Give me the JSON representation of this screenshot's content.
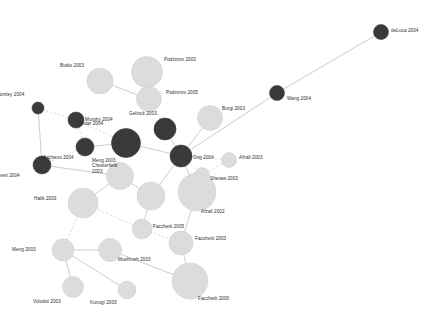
{
  "figure": {
    "kind": "citation-network-graph",
    "background_color": "#ffffff",
    "width": 448,
    "height": 326
  },
  "style": {
    "node_dark_color": "#3a3a3a",
    "node_light_color": "#dcdcdc",
    "node_light_stroke": "#d2d2d2",
    "node_dark_stroke": "#3a3a3a",
    "edge_solid_color": "#b6b6b6",
    "edge_dashed_color": "#c8c8c8",
    "label_color": "#2b2b2b"
  },
  "chart_data": {
    "type": "scatter",
    "title": "",
    "xlabel": "",
    "ylabel": "",
    "nodes": [
      {
        "id": "deluca2004",
        "label": "deLuca 2004",
        "x": 381,
        "y": 32,
        "r": 7.5,
        "shade": "dark",
        "label_dx": 10,
        "label_dy": -2
      },
      {
        "id": "wang2004",
        "label": "Wang 2004",
        "x": 277,
        "y": 93,
        "r": 7.5,
        "shade": "dark",
        "label_dx": 10,
        "label_dy": 5
      },
      {
        "id": "bullo2003",
        "label": "Butko 2003",
        "x": 100,
        "y": 81,
        "r": 13.0,
        "shade": "light",
        "label_dx": -16,
        "label_dy": -16
      },
      {
        "id": "podzorov2003",
        "label": "Podzorov 2003",
        "x": 147,
        "y": 72,
        "r": 15.5,
        "shade": "light",
        "label_dx": 17,
        "label_dy": -13
      },
      {
        "id": "podzorov2005",
        "label": "Podzorov 2005",
        "x": 149,
        "y": 99,
        "r": 12.5,
        "shade": "light",
        "label_dx": 17,
        "label_dy": -7
      },
      {
        "id": "bromley2004",
        "label": "Bromley 2004",
        "x": 38,
        "y": 108,
        "r": 6.0,
        "shade": "dark",
        "label_dx": -14,
        "label_dy": -14
      },
      {
        "id": "murphy2004",
        "label": "Murphy 2004",
        "x": 76,
        "y": 120,
        "r": 8.0,
        "shade": "dark",
        "label_dx": 9,
        "label_dy": -1
      },
      {
        "id": "burgi2003",
        "label": "Burgi 2003",
        "x": 210,
        "y": 118,
        "r": 12.5,
        "shade": "light",
        "label_dx": 12,
        "label_dy": -10
      },
      {
        "id": "gelinck2003",
        "label": "Gelinck 2003",
        "x": 165,
        "y": 129,
        "r": 11.0,
        "shade": "dark",
        "label_dx": -8,
        "label_dy": -16
      },
      {
        "id": "sundar2004",
        "label": "Sundar 2004",
        "x": 126,
        "y": 143,
        "r": 14.5,
        "shade": "dark",
        "label_dx": -23,
        "label_dy": -20
      },
      {
        "id": "arichenu2004",
        "label": "Arichenu 2004",
        "x": 85,
        "y": 147,
        "r": 9.0,
        "shade": "dark",
        "label_dx": -11,
        "label_dy": 10
      },
      {
        "id": "ong2004",
        "label": "Ong 2004",
        "x": 181,
        "y": 156,
        "r": 11.0,
        "shade": "dark",
        "label_dx": 12,
        "label_dy": 1
      },
      {
        "id": "afzali2003",
        "label": "Afzali 2003",
        "x": 229,
        "y": 160,
        "r": 7.5,
        "shade": "light",
        "label_dx": 10,
        "label_dy": -3
      },
      {
        "id": "mactarrent2004",
        "label": "MacTarrent 2004",
        "x": 42,
        "y": 165,
        "r": 9.0,
        "shade": "dark",
        "label_dx": -22,
        "label_dy": 10
      },
      {
        "id": "sheraw2003",
        "label": "Sheraw 2003",
        "x": 202,
        "y": 175,
        "r": 7.5,
        "shade": "light",
        "label_dx": 8,
        "label_dy": 3
      },
      {
        "id": "mengchest",
        "label": "Meng 2003\nChesterfield\n2003",
        "x": 120,
        "y": 176,
        "r": 13.5,
        "shade": "light",
        "label_dx": -3,
        "label_dy": -10
      },
      {
        "id": "afzali2002",
        "label": "Afzali 2002",
        "x": 197,
        "y": 192,
        "r": 19.0,
        "shade": "light",
        "label_dx": 4,
        "label_dy": 19
      },
      {
        "id": "halik2003",
        "label": "Halik 2003",
        "x": 83,
        "y": 203,
        "r": 15.0,
        "shade": "light",
        "label_dx": -26,
        "label_dy": -5
      },
      {
        "id": "interm2003",
        "label": "",
        "x": 151,
        "y": 196,
        "r": 14.0,
        "shade": "light",
        "label_dx": 0,
        "label_dy": 0
      },
      {
        "id": "facchetti2005",
        "label": "Facchetti 2005",
        "x": 142,
        "y": 229,
        "r": 10.0,
        "shade": "light",
        "label_dx": 11,
        "label_dy": -3
      },
      {
        "id": "facchetti2003",
        "label": "Facchetti 2003",
        "x": 181,
        "y": 243,
        "r": 12.0,
        "shade": "light",
        "label_dx": 14,
        "label_dy": -5
      },
      {
        "id": "meng2003b",
        "label": "Meng 2003",
        "x": 63,
        "y": 250,
        "r": 11.0,
        "shade": "light",
        "label_dx": -27,
        "label_dy": -1
      },
      {
        "id": "mushrush2003",
        "label": "Mushrush 2003",
        "x": 110,
        "y": 250,
        "r": 11.5,
        "shade": "light",
        "label_dx": 8,
        "label_dy": 9
      },
      {
        "id": "volodot2003",
        "label": "Volodot 2003",
        "x": 73,
        "y": 287,
        "r": 10.5,
        "shade": "light",
        "label_dx": -12,
        "label_dy": 14
      },
      {
        "id": "kunugi2003",
        "label": "Kunugi 2003",
        "x": 127,
        "y": 290,
        "r": 9.0,
        "shade": "light",
        "label_dx": -10,
        "label_dy": 12
      },
      {
        "id": "facchetti2000",
        "label": "Facchetti 2000",
        "x": 190,
        "y": 281,
        "r": 18.0,
        "shade": "light",
        "label_dx": 8,
        "label_dy": 17
      }
    ],
    "edges": [
      {
        "source": "deluca2004",
        "target": "wang2004",
        "style": "solid"
      },
      {
        "source": "wang2004",
        "target": "ong2004",
        "style": "solid"
      },
      {
        "source": "bullo2003",
        "target": "podzorov2005",
        "style": "solid"
      },
      {
        "source": "podzorov2003",
        "target": "podzorov2005",
        "style": "solid"
      },
      {
        "source": "podzorov2005",
        "target": "gelinck2003",
        "style": "dashed"
      },
      {
        "source": "bromley2004",
        "target": "murphy2004",
        "style": "dashed"
      },
      {
        "source": "bromley2004",
        "target": "mactarrent2004",
        "style": "solid"
      },
      {
        "source": "murphy2004",
        "target": "arichenu2004",
        "style": "dashed"
      },
      {
        "source": "murphy2004",
        "target": "sundar2004",
        "style": "dashed"
      },
      {
        "source": "arichenu2004",
        "target": "sundar2004",
        "style": "solid"
      },
      {
        "source": "arichenu2004",
        "target": "mactarrent2004",
        "style": "dashed"
      },
      {
        "source": "mactarrent2004",
        "target": "mengchest",
        "style": "solid"
      },
      {
        "source": "sundar2004",
        "target": "ong2004",
        "style": "solid"
      },
      {
        "source": "gelinck2003",
        "target": "ong2004",
        "style": "solid"
      },
      {
        "source": "ong2004",
        "target": "afzali2003",
        "style": "dashed"
      },
      {
        "source": "ong2004",
        "target": "sheraw2003",
        "style": "dashed"
      },
      {
        "source": "sheraw2003",
        "target": "afzali2003",
        "style": "dashed"
      },
      {
        "source": "ong2004",
        "target": "burgi2003",
        "style": "solid"
      },
      {
        "source": "ong2004",
        "target": "afzali2002",
        "style": "solid"
      },
      {
        "source": "ong2004",
        "target": "interm2003",
        "style": "solid"
      },
      {
        "source": "mengchest",
        "target": "interm2003",
        "style": "solid"
      },
      {
        "source": "mengchest",
        "target": "halik2003",
        "style": "solid"
      },
      {
        "source": "halik2003",
        "target": "facchetti2005",
        "style": "dashed"
      },
      {
        "source": "interm2003",
        "target": "facchetti2005",
        "style": "solid"
      },
      {
        "source": "afzali2002",
        "target": "facchetti2003",
        "style": "solid"
      },
      {
        "source": "facchetti2005",
        "target": "facchetti2003",
        "style": "dashed"
      },
      {
        "source": "halik2003",
        "target": "meng2003b",
        "style": "dashed"
      },
      {
        "source": "meng2003b",
        "target": "mushrush2003",
        "style": "solid"
      },
      {
        "source": "meng2003b",
        "target": "volodot2003",
        "style": "solid"
      },
      {
        "source": "meng2003b",
        "target": "kunugi2003",
        "style": "solid"
      },
      {
        "source": "facchetti2003",
        "target": "facchetti2000",
        "style": "solid"
      },
      {
        "source": "mushrush2003",
        "target": "facchetti2000",
        "style": "solid"
      }
    ]
  }
}
